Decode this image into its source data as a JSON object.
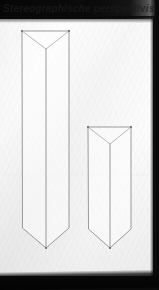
{
  "photo": {
    "title_strip_text": "Stereographische perspektivische Prismen Skizze",
    "border_color": "#0a0a0a",
    "paper_color": "#fbfbfb",
    "ink_color": "#8e8e92"
  },
  "canvas": {
    "width": 159,
    "height": 290
  },
  "drawing": {
    "caption": "Two vertical triangular prisms drawn in perspective on white paper",
    "medium": "pencil on paper",
    "shapes": [
      {
        "name": "tall-prism",
        "label": "Tall triangular prism",
        "top_left_x": 22,
        "top_right_x": 69,
        "top_y": 31,
        "front_edge_x": 46,
        "top_apex_y": 49,
        "side_bottom_y": 228,
        "bottom_apex_y": 248,
        "height_px": 217,
        "width_px": 47
      },
      {
        "name": "short-prism",
        "label": "Short triangular prism",
        "top_left_x": 88,
        "top_right_x": 131,
        "top_y": 127,
        "front_edge_x": 110,
        "top_apex_y": 144,
        "side_bottom_y": 229,
        "bottom_apex_y": 248,
        "height_px": 121,
        "width_px": 43
      }
    ]
  }
}
